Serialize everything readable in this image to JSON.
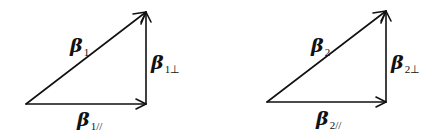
{
  "diagram": {
    "type": "vector-decomposition",
    "triangles": [
      {
        "id": "triangle-1",
        "vertices": {
          "origin": [
            26,
            104
          ],
          "corner": [
            146,
            104
          ],
          "apex": [
            146,
            12
          ]
        },
        "labels": {
          "hypotenuse": {
            "symbol": "β",
            "subscript": "1"
          },
          "vertical": {
            "symbol": "β",
            "subscript": "1⊥"
          },
          "horizontal": {
            "symbol": "β",
            "subscript": "1//"
          }
        }
      },
      {
        "id": "triangle-2",
        "vertices": {
          "origin": [
            267,
            102
          ],
          "corner": [
            386,
            102
          ],
          "apex": [
            386,
            11
          ]
        },
        "labels": {
          "hypotenuse": {
            "symbol": "β",
            "subscript": "2"
          },
          "vertical": {
            "symbol": "β",
            "subscript": "2⊥"
          },
          "horizontal": {
            "symbol": "β",
            "subscript": "2//"
          }
        }
      }
    ],
    "colors": {
      "stroke": "#111111",
      "background": "#ffffff"
    }
  }
}
